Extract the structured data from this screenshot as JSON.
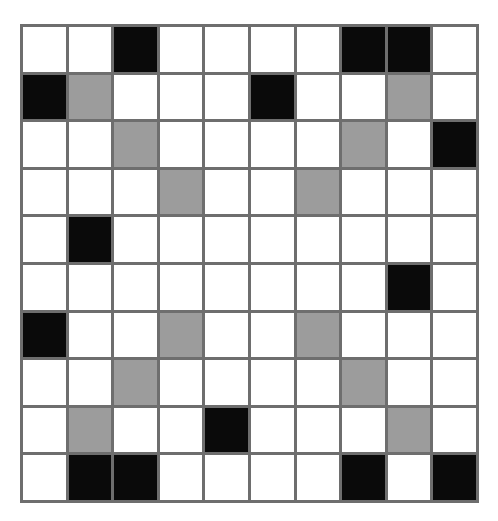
{
  "canvas": {
    "width": 498,
    "height": 521,
    "background": "#ffffff"
  },
  "grid": {
    "name": "ten-by-ten-shaded-grid",
    "rows": 10,
    "columns": 10,
    "line_color": "#6e6e6e",
    "line_width_px": 3,
    "origin": {
      "x": 20,
      "y": 24
    },
    "size": {
      "width": 459,
      "height": 479
    },
    "cell_size_px": {
      "width": 43,
      "height": 45
    },
    "palette": {
      "white": "#ffffff",
      "gray": "#9c9c9c",
      "black": "#0a0a0a"
    },
    "legend": [
      {
        "key": "white",
        "label": "empty",
        "color": "#ffffff"
      },
      {
        "key": "gray",
        "label": "shaded",
        "color": "#9c9c9c"
      },
      {
        "key": "black",
        "label": "filled",
        "color": "#0a0a0a"
      }
    ],
    "counts": {
      "white": 72,
      "gray": 14,
      "black": 14
    },
    "cells": [
      [
        "white",
        "white",
        "black",
        "white",
        "white",
        "white",
        "white",
        "black",
        "black",
        "white"
      ],
      [
        "black",
        "gray",
        "white",
        "white",
        "white",
        "black",
        "white",
        "white",
        "gray",
        "white"
      ],
      [
        "white",
        "white",
        "gray",
        "white",
        "white",
        "white",
        "white",
        "gray",
        "white",
        "black"
      ],
      [
        "white",
        "white",
        "white",
        "gray",
        "white",
        "white",
        "gray",
        "white",
        "white",
        "white"
      ],
      [
        "white",
        "black",
        "white",
        "white",
        "white",
        "white",
        "white",
        "white",
        "white",
        "white"
      ],
      [
        "white",
        "white",
        "white",
        "white",
        "white",
        "white",
        "white",
        "white",
        "black",
        "white"
      ],
      [
        "black",
        "white",
        "white",
        "gray",
        "white",
        "white",
        "gray",
        "white",
        "white",
        "white"
      ],
      [
        "white",
        "white",
        "gray",
        "white",
        "white",
        "white",
        "white",
        "gray",
        "white",
        "white"
      ],
      [
        "white",
        "gray",
        "white",
        "white",
        "black",
        "white",
        "white",
        "white",
        "gray",
        "white"
      ],
      [
        "white",
        "black",
        "black",
        "white",
        "white",
        "white",
        "white",
        "black",
        "white",
        "black"
      ]
    ]
  }
}
